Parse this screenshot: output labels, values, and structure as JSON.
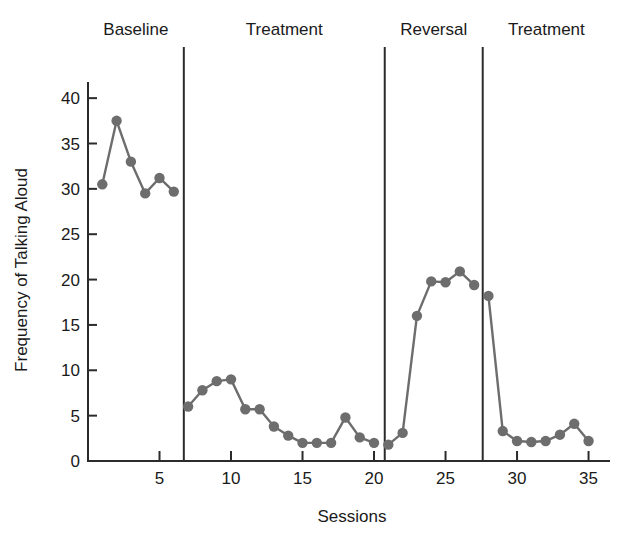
{
  "chart_data": {
    "type": "line",
    "title": "",
    "xlabel": "Sessions",
    "ylabel": "Frequency of Talking Aloud",
    "xlim": [
      0,
      36.5
    ],
    "ylim": [
      0,
      42
    ],
    "xticks": [
      5,
      10,
      15,
      20,
      25,
      30,
      35
    ],
    "yticks": [
      0,
      5,
      10,
      15,
      20,
      25,
      30,
      35,
      40
    ],
    "grid": false,
    "legend": "none",
    "marker": "circle",
    "series_color": "#6d6d6d",
    "axis_color": "#2b2b2b",
    "phases": [
      {
        "name": "Baseline",
        "label": "Baseline",
        "x_start": 1,
        "x_end": 6,
        "divider_after": 6.7
      },
      {
        "name": "Treatment1",
        "label": "Treatment",
        "x_start": 7,
        "x_end": 20,
        "divider_after": 20.75
      },
      {
        "name": "Reversal",
        "label": "Reversal",
        "x_start": 21,
        "x_end": 27,
        "divider_after": 27.6
      },
      {
        "name": "Treatment2",
        "label": "Treatment",
        "x_start": 28,
        "x_end": 35,
        "divider_after": null
      }
    ],
    "series": [
      {
        "name": "Frequency of Talking Aloud",
        "x": [
          1,
          2,
          3,
          4,
          5,
          6,
          7,
          8,
          9,
          10,
          11,
          12,
          13,
          14,
          15,
          16,
          17,
          18,
          19,
          20,
          21,
          22,
          23,
          24,
          25,
          26,
          27,
          28,
          29,
          30,
          31,
          32,
          33,
          34,
          35
        ],
        "values": [
          30.5,
          37.5,
          33.0,
          29.5,
          31.2,
          29.7,
          6.0,
          7.8,
          8.8,
          9.0,
          5.7,
          5.7,
          3.8,
          2.8,
          2.0,
          2.0,
          2.0,
          4.8,
          2.6,
          2.0,
          1.8,
          3.1,
          16.0,
          19.8,
          19.7,
          20.9,
          19.4,
          18.2,
          3.3,
          2.2,
          2.1,
          2.2,
          2.9,
          4.1,
          2.2
        ]
      }
    ],
    "segment_breaks": [
      5,
      19,
      26
    ]
  }
}
